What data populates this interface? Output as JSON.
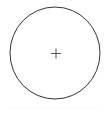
{
  "figure": {
    "title": "Circle with center crosshair marker",
    "background_color": "#ffffff",
    "width": 110,
    "height": 114,
    "shapes": {
      "circle": {
        "label": "circle-outline",
        "center_x": 55,
        "center_y": 53,
        "radius_x": 45,
        "radius_y": 46,
        "stroke_color": "#333333",
        "stroke_width": 1,
        "fill": "none"
      },
      "crosshair": {
        "label": "center-crosshair-marker",
        "glyph": "+",
        "center_x": 56,
        "center_y": 53.5,
        "arm_length": 5,
        "stroke_color": "#555555",
        "stroke_width": 1
      },
      "baseline": {
        "label": "faint-baseline-rule",
        "x1": 8,
        "x2": 102,
        "y": 108,
        "stroke_color": "#fbfbfb",
        "stroke_width": 1
      }
    }
  }
}
